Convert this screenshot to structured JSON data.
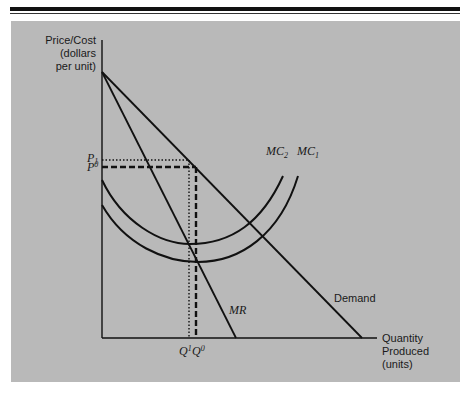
{
  "figure": {
    "y_axis_label": [
      "Price/Cost",
      "(dollars",
      "per unit)"
    ],
    "x_axis_label": [
      "Quantity",
      "Produced",
      "(units)"
    ],
    "curves": {
      "demand": "Demand",
      "mr": "MR",
      "mc1": {
        "base": "MC",
        "sub": "1"
      },
      "mc2": {
        "base": "MC",
        "sub": "2"
      }
    },
    "price_ticks": {
      "p1": {
        "base": "P",
        "sub": "1"
      },
      "p0": {
        "base": "P",
        "sup": "0"
      }
    },
    "quantity_ticks": {
      "q1": {
        "base": "Q",
        "sup": "1"
      },
      "q0": {
        "base": "Q",
        "sup": "0"
      }
    },
    "colors": {
      "panel_background": "#b9b9b9",
      "line": "#111111",
      "page": "#ffffff"
    }
  }
}
